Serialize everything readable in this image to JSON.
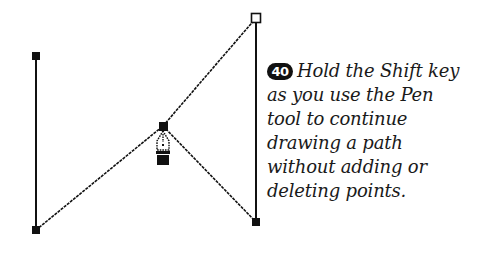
{
  "figure": {
    "step_number": "40",
    "caption_lines": [
      "Hold the Shift key",
      "as you use the Pen",
      "tool to continue",
      "drawing a path",
      "without adding or",
      "deleting points."
    ],
    "caption_full": "Hold the Shift key as you use the Pen tool to continue drawing a path without adding or deleting points."
  },
  "diagram": {
    "tool": "pen-tool-cursor",
    "anchor_points": [
      {
        "id": "top-left",
        "x": 36,
        "y": 56,
        "style": "filled"
      },
      {
        "id": "bottom-left",
        "x": 36,
        "y": 230,
        "style": "filled"
      },
      {
        "id": "middle",
        "x": 163,
        "y": 126,
        "style": "filled"
      },
      {
        "id": "top-right",
        "x": 256,
        "y": 18,
        "style": "hollow"
      },
      {
        "id": "bottom-right",
        "x": 256,
        "y": 222,
        "style": "filled"
      }
    ],
    "segments": [
      {
        "from": "top-left",
        "to": "bottom-left",
        "style": "solid"
      },
      {
        "from": "bottom-left",
        "to": "middle",
        "style": "jagged"
      },
      {
        "from": "middle",
        "to": "top-right",
        "style": "jagged"
      },
      {
        "from": "top-right",
        "to": "bottom-right",
        "style": "solid"
      },
      {
        "from": "middle",
        "to": "bottom-right",
        "style": "jagged"
      }
    ],
    "colors": {
      "stroke": "#111111",
      "fill": "#111111",
      "hollow_fill": "#ffffff",
      "background": "#ffffff"
    }
  }
}
